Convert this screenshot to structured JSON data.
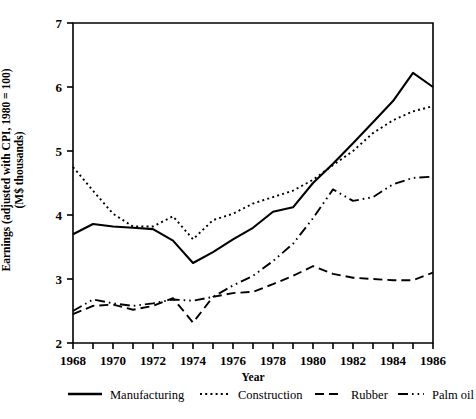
{
  "chart_data": {
    "type": "line",
    "title": "",
    "xlabel": "Year",
    "ylabel": "Earnings (adjusted with CPI, 1980 = 100) (M$ thousands)",
    "ylabel_line1": "Earnings (adjusted with CPI, 1980 = 100)",
    "ylabel_line2": "(M$ thousands)",
    "x": [
      1968,
      1969,
      1970,
      1971,
      1972,
      1973,
      1974,
      1975,
      1976,
      1977,
      1978,
      1979,
      1980,
      1981,
      1982,
      1983,
      1984,
      1985,
      1986
    ],
    "xlim": [
      1968,
      1986
    ],
    "ylim": [
      2,
      7
    ],
    "xticks": [
      1968,
      1969,
      1970,
      1971,
      1972,
      1973,
      1974,
      1975,
      1976,
      1977,
      1978,
      1979,
      1980,
      1981,
      1982,
      1983,
      1984,
      1985,
      1986
    ],
    "xtick_labels": [
      "1968",
      "",
      "1970",
      "",
      "1972",
      "",
      "1974",
      "",
      "1976",
      "",
      "1978",
      "",
      "1980",
      "",
      "1982",
      "",
      "1984",
      "",
      "1986"
    ],
    "yticks": [
      2,
      3,
      4,
      5,
      6,
      7
    ],
    "ytick_labels": [
      "2",
      "3",
      "4",
      "5",
      "6",
      "7"
    ],
    "grid": false,
    "legend_position": "bottom",
    "series": [
      {
        "name": "Manufacturing",
        "style": "solid",
        "color": "#000000",
        "values": [
          3.7,
          3.86,
          3.82,
          3.8,
          3.78,
          3.6,
          3.25,
          3.42,
          3.62,
          3.8,
          4.05,
          4.12,
          4.5,
          4.8,
          5.12,
          5.45,
          5.78,
          6.22,
          6.0
        ]
      },
      {
        "name": "Construction",
        "style": "dotted",
        "color": "#000000",
        "values": [
          4.75,
          4.38,
          4.02,
          3.82,
          3.82,
          3.98,
          3.62,
          3.92,
          4.02,
          4.18,
          4.28,
          4.38,
          4.55,
          4.78,
          5.0,
          5.28,
          5.48,
          5.62,
          5.7
        ]
      },
      {
        "name": "Rubber",
        "style": "dashed",
        "color": "#000000",
        "values": [
          2.45,
          2.58,
          2.6,
          2.52,
          2.58,
          2.7,
          2.32,
          2.72,
          2.78,
          2.8,
          2.92,
          3.05,
          3.2,
          3.08,
          3.02,
          3.0,
          2.98,
          2.98,
          3.1
        ]
      },
      {
        "name": "Palm oil",
        "style": "dashdot",
        "color": "#000000",
        "values": [
          2.5,
          2.68,
          2.62,
          2.58,
          2.62,
          2.68,
          2.66,
          2.72,
          2.9,
          3.05,
          3.28,
          3.55,
          3.95,
          4.4,
          4.22,
          4.28,
          4.48,
          4.58,
          4.6
        ]
      }
    ]
  },
  "axes": {
    "x_axis_title": "Year",
    "y_axis_title_line1": "Earnings (adjusted with CPI, 1980 = 100)",
    "y_axis_title_line2": "(M$ thousands)"
  },
  "legend": {
    "items": [
      {
        "label": "Manufacturing",
        "style": "solid"
      },
      {
        "label": "Construction",
        "style": "dotted"
      },
      {
        "label": "Rubber",
        "style": "dashed"
      },
      {
        "label": "Palm oil",
        "style": "dashdot"
      }
    ]
  }
}
